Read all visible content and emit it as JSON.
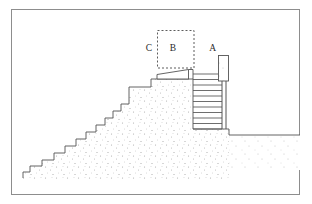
{
  "figure": {
    "kind": "line-drawing",
    "title": "",
    "background_color": "#ffffff",
    "ink_color": "#4a4a4a",
    "stipple_color": "#9a9a9a",
    "frame": {
      "name": "outer-border",
      "x": 11,
      "y": 9,
      "width": 289,
      "height": 186,
      "stroke": "#8d8d8d",
      "stroke_width": 1
    },
    "labels": [
      {
        "id": "label-c",
        "text": "C",
        "x": 149,
        "y": 51
      },
      {
        "id": "label-b",
        "text": "B",
        "x": 173,
        "y": 51
      },
      {
        "id": "label-a",
        "text": "A",
        "x": 213,
        "y": 51
      }
    ],
    "dashed_box": {
      "name": "zone-b-dashed-outline",
      "x": 157,
      "y": 30,
      "width": 37,
      "height": 38,
      "stroke": "#4a4a4a",
      "dash": "2,2"
    },
    "elements": {
      "embankment_name": "stepped-embankment-mass",
      "staircase_name": "exterior-stair-flight",
      "staircase_steps": 11,
      "ladder_name": "interior-step-flight-zone-a",
      "ladder_rungs": 10,
      "post_name": "vertical-post",
      "slab_name": "wedge-slab-zone-bc",
      "ground_name": "ground-line"
    },
    "geometry": {
      "embankment_outline": "M 23,172 L 30,172 L 30,166 L 42,166 L 42,160 L 54,160 L 54,153 L 65,153 L 65,146 L 76,146 L 76,139 L 86,139 L 86,132 L 96,132 L 96,125 L 105,125 L 105,118 L 113,118 L 113,111 L 121,111 L 121,104 L 129,104 L 129,87 L 151,87 L 151,79 L 193,79 L 193,129 L 229,129 L 229,135 L 300,135",
      "stair_tread_xs": [
        23,
        30,
        42,
        54,
        65,
        76,
        86,
        96,
        105,
        113,
        121
      ],
      "slab_polygon": "157,74 188,70 188,79 157,79",
      "post_rect": {
        "x": 218,
        "y": 55,
        "width": 11,
        "height": 26
      },
      "ladder_rect": {
        "x": 193,
        "y": 74,
        "width": 36,
        "height": 55
      },
      "ground_line_y": 135
    }
  }
}
